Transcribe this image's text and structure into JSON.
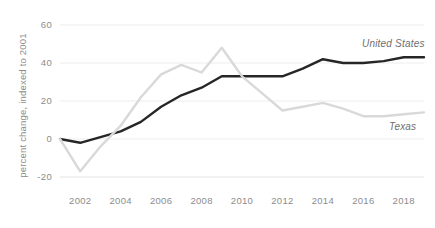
{
  "chart_data": {
    "type": "line",
    "title": "",
    "subtitle": "",
    "xlabel": "",
    "ylabel": "percent change, indexed to 2001",
    "x": [
      2001,
      2002,
      2003,
      2004,
      2005,
      2006,
      2007,
      2008,
      2009,
      2010,
      2011,
      2012,
      2013,
      2014,
      2015,
      2016,
      2017,
      2018,
      2019
    ],
    "xlim": [
      2001,
      2019
    ],
    "ylim": [
      -20,
      60
    ],
    "xticks": [
      2002,
      2004,
      2006,
      2008,
      2010,
      2012,
      2014,
      2016,
      2018
    ],
    "xtick_labels": [
      "2002",
      "2004",
      "2006",
      "2008",
      "2010",
      "2012",
      "2014",
      "2016",
      "2018"
    ],
    "yticks": [
      -20,
      0,
      20,
      40,
      60
    ],
    "ytick_labels": [
      "-20",
      "0",
      "20",
      "40",
      "60"
    ],
    "grid": true,
    "grid_axis": "y",
    "legend_position": "inline-right",
    "series": [
      {
        "name": "United States",
        "color": "#262626",
        "values": [
          0,
          -2,
          1,
          4,
          9,
          17,
          23,
          27,
          33,
          33,
          33,
          33,
          37,
          42,
          40,
          40,
          41,
          43,
          43
        ]
      },
      {
        "name": "Texas",
        "color": "#d9d9d9",
        "values": [
          0,
          -17,
          -4,
          7,
          22,
          34,
          39,
          35,
          48,
          33,
          24,
          15,
          17,
          19,
          16,
          12,
          12,
          13,
          14
        ]
      }
    ],
    "annotations": [
      {
        "text": "United States",
        "series": "United States"
      },
      {
        "text": "Texas",
        "series": "Texas"
      }
    ]
  }
}
